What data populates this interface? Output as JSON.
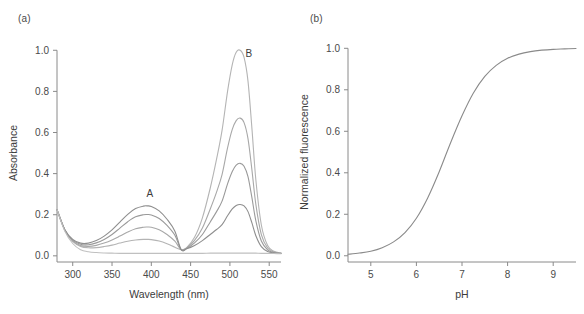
{
  "figure": {
    "panel_a_label": "(a)",
    "panel_b_label": "(b)"
  },
  "chart_data": [
    {
      "panel": "(a)",
      "type": "line",
      "title": "",
      "xlabel": "Wavelength (nm)",
      "ylabel": "Absorbance",
      "xlim": [
        280,
        565
      ],
      "ylim": [
        -0.03,
        1.05
      ],
      "xticks": [
        300,
        350,
        400,
        450,
        500,
        550
      ],
      "yticks": [
        0.0,
        0.2,
        0.4,
        0.6,
        0.8,
        1.0
      ],
      "xtick_labels": [
        "300",
        "350",
        "400",
        "450",
        "500",
        "550"
      ],
      "ytick_labels": [
        "0.0",
        "0.2",
        "0.4",
        "0.6",
        "0.8",
        "1.0"
      ],
      "grid": false,
      "legend": "none",
      "annotations": [
        {
          "text": "A",
          "x": 398,
          "y": 0.285,
          "describes": "protonated absorption band near 395 nm"
        },
        {
          "text": "B",
          "x": 524,
          "y": 0.965,
          "describes": "deprotonated absorption band near 513 nm"
        }
      ],
      "isosbestic_point_nm": 438,
      "peak_a_nm": 395,
      "peak_b_nm": 513,
      "series": [
        {
          "name": "curve-1-highest-pH",
          "color": "#b4b4b4",
          "peak_a": 0.08,
          "peak_b": 1.0,
          "x": [
            280,
            290,
            300,
            310,
            320,
            330,
            340,
            350,
            360,
            370,
            380,
            390,
            395,
            400,
            410,
            420,
            430,
            438,
            445,
            455,
            465,
            475,
            483,
            490,
            497,
            503,
            508,
            513,
            518,
            523,
            528,
            533,
            540,
            548,
            556,
            565
          ],
          "values": [
            0.225,
            0.125,
            0.07,
            0.046,
            0.039,
            0.04,
            0.045,
            0.052,
            0.062,
            0.071,
            0.077,
            0.08,
            0.08,
            0.079,
            0.072,
            0.059,
            0.042,
            0.03,
            0.04,
            0.09,
            0.185,
            0.33,
            0.47,
            0.61,
            0.8,
            0.93,
            0.99,
            1.0,
            0.965,
            0.85,
            0.62,
            0.37,
            0.15,
            0.05,
            0.022,
            0.014
          ]
        },
        {
          "name": "curve-2",
          "color": "#a8a8a8",
          "peak_a": 0.14,
          "peak_b": 0.67,
          "x": [
            280,
            290,
            300,
            310,
            320,
            330,
            340,
            350,
            360,
            370,
            380,
            390,
            395,
            400,
            410,
            420,
            430,
            438,
            445,
            455,
            465,
            475,
            483,
            490,
            497,
            503,
            508,
            513,
            518,
            523,
            528,
            533,
            540,
            548,
            556,
            565
          ],
          "values": [
            0.225,
            0.125,
            0.072,
            0.05,
            0.046,
            0.051,
            0.062,
            0.077,
            0.096,
            0.116,
            0.132,
            0.139,
            0.14,
            0.139,
            0.127,
            0.104,
            0.071,
            0.03,
            0.038,
            0.075,
            0.135,
            0.228,
            0.31,
            0.395,
            0.525,
            0.615,
            0.658,
            0.67,
            0.648,
            0.57,
            0.418,
            0.25,
            0.103,
            0.038,
            0.019,
            0.013
          ]
        },
        {
          "name": "curve-3",
          "color": "#9a9a9a",
          "peak_a": 0.2,
          "peak_b": 0.45,
          "x": [
            280,
            290,
            300,
            310,
            320,
            330,
            340,
            350,
            360,
            370,
            380,
            390,
            395,
            400,
            410,
            420,
            430,
            438,
            445,
            455,
            465,
            475,
            483,
            490,
            497,
            503,
            508,
            513,
            518,
            523,
            528,
            533,
            540,
            548,
            556,
            565
          ],
          "values": [
            0.225,
            0.126,
            0.076,
            0.056,
            0.054,
            0.063,
            0.08,
            0.104,
            0.135,
            0.166,
            0.19,
            0.2,
            0.201,
            0.199,
            0.182,
            0.148,
            0.1,
            0.03,
            0.036,
            0.063,
            0.104,
            0.165,
            0.215,
            0.266,
            0.35,
            0.41,
            0.441,
            0.45,
            0.436,
            0.385,
            0.283,
            0.17,
            0.072,
            0.029,
            0.016,
            0.012
          ]
        },
        {
          "name": "curve-4",
          "color": "#8e8e8e",
          "peak_a": 0.24,
          "peak_b": 0.25,
          "x": [
            280,
            290,
            300,
            310,
            320,
            330,
            340,
            350,
            360,
            370,
            380,
            390,
            395,
            400,
            410,
            420,
            430,
            438,
            445,
            455,
            465,
            475,
            483,
            490,
            497,
            503,
            508,
            513,
            518,
            523,
            528,
            533,
            540,
            548,
            556,
            565
          ],
          "values": [
            0.225,
            0.127,
            0.08,
            0.062,
            0.062,
            0.074,
            0.096,
            0.126,
            0.164,
            0.202,
            0.23,
            0.242,
            0.243,
            0.24,
            0.219,
            0.178,
            0.12,
            0.03,
            0.034,
            0.05,
            0.074,
            0.104,
            0.128,
            0.152,
            0.195,
            0.228,
            0.245,
            0.25,
            0.243,
            0.215,
            0.16,
            0.098,
            0.045,
            0.021,
            0.014,
            0.011
          ]
        },
        {
          "name": "curve-5-baseline-lowest-pH",
          "color": "#c0c0c0",
          "peak_a": 0.012,
          "peak_b": 0.013,
          "x": [
            280,
            290,
            300,
            310,
            320,
            330,
            340,
            350,
            360,
            370,
            380,
            390,
            395,
            400,
            410,
            420,
            430,
            438,
            445,
            455,
            465,
            475,
            483,
            490,
            497,
            503,
            508,
            513,
            518,
            523,
            528,
            533,
            540,
            548,
            556,
            565
          ],
          "values": [
            0.225,
            0.12,
            0.06,
            0.03,
            0.02,
            0.016,
            0.014,
            0.013,
            0.012,
            0.012,
            0.012,
            0.012,
            0.012,
            0.012,
            0.012,
            0.012,
            0.012,
            0.012,
            0.012,
            0.012,
            0.012,
            0.013,
            0.013,
            0.013,
            0.013,
            0.013,
            0.013,
            0.013,
            0.013,
            0.013,
            0.013,
            0.013,
            0.012,
            0.012,
            0.011,
            0.01
          ]
        }
      ]
    },
    {
      "panel": "(b)",
      "type": "line",
      "title": "",
      "xlabel": "pH",
      "ylabel": "Normalized fluorescence",
      "xlim": [
        4.5,
        9.5
      ],
      "ylim": [
        -0.03,
        1.04
      ],
      "xticks": [
        5,
        6,
        7,
        8,
        9
      ],
      "yticks": [
        0.0,
        0.2,
        0.4,
        0.6,
        0.8,
        1.0
      ],
      "xtick_labels": [
        "5",
        "6",
        "7",
        "8",
        "9"
      ],
      "ytick_labels": [
        "0.0",
        "0.2",
        "0.4",
        "0.6",
        "0.8",
        "1.0"
      ],
      "grid": false,
      "legend": "none",
      "pKa": 6.95,
      "hill_slope": 1.05,
      "series": [
        {
          "name": "ph-titration-sigmoid",
          "color": "#8a8a8a",
          "x": [
            4.5,
            4.75,
            5.0,
            5.25,
            5.5,
            5.75,
            6.0,
            6.25,
            6.5,
            6.75,
            7.0,
            7.25,
            7.5,
            7.75,
            8.0,
            8.25,
            8.5,
            8.75,
            9.0,
            9.25,
            9.5
          ],
          "values": [
            0.007,
            0.013,
            0.022,
            0.039,
            0.067,
            0.112,
            0.181,
            0.28,
            0.405,
            0.545,
            0.675,
            0.785,
            0.865,
            0.918,
            0.952,
            0.972,
            0.984,
            0.991,
            0.995,
            0.997,
            0.999
          ]
        }
      ]
    }
  ]
}
